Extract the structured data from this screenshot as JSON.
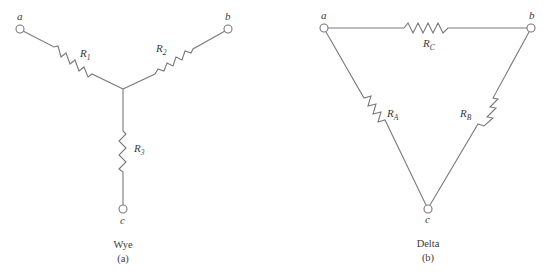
{
  "figure": {
    "wye": {
      "caption": "Wye",
      "sub_caption": "(a)",
      "nodes": {
        "a": "a",
        "b": "b",
        "c": "c"
      },
      "resistors": [
        {
          "id": "R1",
          "symbol": "R",
          "subscript": "1",
          "between": [
            "a",
            "center"
          ]
        },
        {
          "id": "R2",
          "symbol": "R",
          "subscript": "2",
          "between": [
            "b",
            "center"
          ]
        },
        {
          "id": "R3",
          "symbol": "R",
          "subscript": "3",
          "between": [
            "c",
            "center"
          ]
        }
      ]
    },
    "delta": {
      "caption": "Delta",
      "sub_caption": "(b)",
      "nodes": {
        "a": "a",
        "b": "b",
        "c": "c"
      },
      "resistors": [
        {
          "id": "RC",
          "symbol": "R",
          "subscript": "C",
          "between": [
            "a",
            "b"
          ]
        },
        {
          "id": "RA",
          "symbol": "R",
          "subscript": "A",
          "between": [
            "a",
            "c"
          ]
        },
        {
          "id": "RB",
          "symbol": "R",
          "subscript": "B",
          "between": [
            "b",
            "c"
          ]
        }
      ]
    }
  }
}
